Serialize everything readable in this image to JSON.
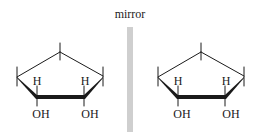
{
  "figure": {
    "mirror_label": "mirror",
    "mirror_color": "#cfcfcf",
    "ink_color": "#1a1a1a",
    "molecules": [
      {
        "name": "left-enantiomer",
        "labels": {
          "h_left": "H",
          "h_right": "H",
          "oh_left": "OH",
          "oh_right": "OH"
        }
      },
      {
        "name": "right-enantiomer",
        "labels": {
          "h_left": "H",
          "h_right": "H",
          "oh_left": "OH",
          "oh_right": "OH"
        }
      }
    ]
  }
}
